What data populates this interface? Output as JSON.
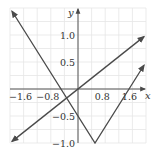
{
  "chart_data": {
    "type": "line",
    "title": "",
    "xlabel": "x",
    "ylabel": "y",
    "xlim": [
      -2.0,
      2.0
    ],
    "ylim": [
      -1.0,
      1.5
    ],
    "grid": true,
    "x_ticks": [
      {
        "value": -1.6,
        "label": "−1.6"
      },
      {
        "value": -0.8,
        "label": "−0.8"
      },
      {
        "value": 0.8,
        "label": "0.8"
      },
      {
        "value": 1.6,
        "label": "1.6"
      }
    ],
    "y_ticks": [
      {
        "value": 1.0,
        "label": "1.0"
      },
      {
        "value": 0.5,
        "label": "0.5"
      },
      {
        "value": -0.5,
        "label": "−0.5"
      },
      {
        "value": -1.0,
        "label": "−1.0"
      }
    ],
    "series": [
      {
        "name": "y = 0.5x",
        "points": [
          [
            -1.94,
            -0.97
          ],
          [
            1.94,
            0.97
          ]
        ],
        "arrows": "both"
      },
      {
        "name": "y = |x - 0.5| - 1",
        "points": [
          [
            -1.94,
            1.44
          ],
          [
            0.5,
            -1.0
          ],
          [
            1.94,
            0.44
          ]
        ],
        "arrows": "both"
      }
    ],
    "colors": {
      "curve": "#4a4a4a",
      "axis": "#555555",
      "grid": "#e6e6e6",
      "background": "#ffffff"
    }
  }
}
